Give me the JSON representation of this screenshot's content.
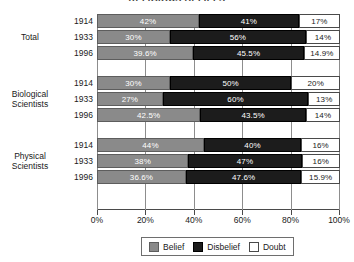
{
  "chart_data": {
    "type": "bar",
    "subtype": "stacked-horizontal-100pct",
    "title": "RELIGIOUS BELIEFS",
    "xlabel": "",
    "ylabel": "",
    "xlim": [
      0,
      100
    ],
    "xticks": [
      0,
      20,
      40,
      60,
      80,
      100
    ],
    "xtick_labels": [
      "0%",
      "20%",
      "40%",
      "60%",
      "80%",
      "100%"
    ],
    "grid": true,
    "legend_position": "bottom",
    "series": [
      {
        "name": "Belief",
        "color": "#8a8a8a"
      },
      {
        "name": "Disbelief",
        "color": "#1c1c1c"
      },
      {
        "name": "Doubt",
        "color": "#ffffff"
      }
    ],
    "groups": [
      {
        "label": "Total",
        "label_lines": [
          "Total"
        ],
        "rows": [
          {
            "category": "1914",
            "values": [
              42,
              41,
              17
            ],
            "labels": [
              "42%",
              "41%",
              "17%"
            ]
          },
          {
            "category": "1933",
            "values": [
              30,
              56,
              14
            ],
            "labels": [
              "30%",
              "56%",
              "14%"
            ]
          },
          {
            "category": "1996",
            "values": [
              39.6,
              45.5,
              14.9
            ],
            "labels": [
              "39.6%",
              "45.5%",
              "14.9%"
            ]
          }
        ]
      },
      {
        "label": "Biological Scientists",
        "label_lines": [
          "Biological",
          "Scientists"
        ],
        "rows": [
          {
            "category": "1914",
            "values": [
              30,
              50,
              20
            ],
            "labels": [
              "30%",
              "50%",
              "20%"
            ]
          },
          {
            "category": "1933",
            "values": [
              27,
              60,
              13
            ],
            "labels": [
              "27%",
              "60%",
              "13%"
            ]
          },
          {
            "category": "1996",
            "values": [
              42.5,
              43.5,
              14
            ],
            "labels": [
              "42.5%",
              "43.5%",
              "14%"
            ]
          }
        ]
      },
      {
        "label": "Physical Scientists",
        "label_lines": [
          "Physical",
          "Scientists"
        ],
        "rows": [
          {
            "category": "1914",
            "values": [
              44,
              40,
              16
            ],
            "labels": [
              "44%",
              "40%",
              "16%"
            ]
          },
          {
            "category": "1933",
            "values": [
              38,
              47,
              16
            ],
            "labels": [
              "38%",
              "47%",
              "16%"
            ]
          },
          {
            "category": "1996",
            "values": [
              36.6,
              47.6,
              15.9
            ],
            "labels": [
              "36.6%",
              "47.6%",
              "15.9%"
            ]
          }
        ]
      }
    ]
  },
  "legend": {
    "items": [
      {
        "label": "Belief",
        "color": "#8a8a8a"
      },
      {
        "label": "Disbelief",
        "color": "#1c1c1c"
      },
      {
        "label": "Doubt",
        "color": "#ffffff"
      }
    ]
  }
}
